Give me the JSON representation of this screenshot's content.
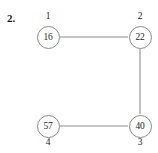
{
  "figure": {
    "exercise_number": "2.",
    "width": 158,
    "height": 153,
    "background_color": "#ffffff",
    "stroke_color": "#8c8c8c",
    "text_color": "#1f1f1f"
  },
  "graph": {
    "type": "undirected-graph",
    "nodes": [
      {
        "id": "n1",
        "label": "1",
        "value": "16",
        "cx": 48,
        "cy": 37,
        "r": 11.5,
        "label_position": "above"
      },
      {
        "id": "n2",
        "label": "2",
        "value": "22",
        "cx": 140,
        "cy": 37,
        "r": 11.5,
        "label_position": "above"
      },
      {
        "id": "n3",
        "label": "3",
        "value": "40",
        "cx": 140,
        "cy": 126,
        "r": 11.5,
        "label_position": "below"
      },
      {
        "id": "n4",
        "label": "4",
        "value": "57",
        "cx": 48,
        "cy": 126,
        "r": 11.5,
        "label_position": "below"
      }
    ],
    "edges": [
      {
        "id": "e1",
        "from": "n1",
        "to": "n2",
        "x1": 60,
        "y1": 37,
        "x2": 128,
        "y2": 37
      },
      {
        "id": "e2",
        "from": "n2",
        "to": "n3",
        "x1": 140,
        "y1": 49,
        "x2": 140,
        "y2": 114
      },
      {
        "id": "e3",
        "from": "n4",
        "to": "n3",
        "x1": 60,
        "y1": 126,
        "x2": 128,
        "y2": 126
      }
    ]
  }
}
